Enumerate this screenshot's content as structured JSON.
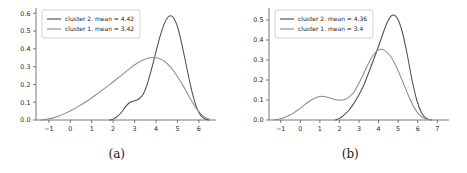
{
  "figure": {
    "background_color": "#ffffff",
    "axis_color": "#555555",
    "subfigures": [
      {
        "caption": "(a)",
        "chart_data": {
          "type": "line",
          "title": "",
          "xlabel": "",
          "ylabel": "",
          "xlim": [
            -1.6,
            6.8
          ],
          "ylim": [
            0.0,
            0.63
          ],
          "grid": false,
          "legend_position": "upper left",
          "xticks": [
            -1,
            0,
            1,
            2,
            3,
            4,
            5,
            6
          ],
          "xtick_labels": [
            "−1",
            "0",
            "1",
            "2",
            "3",
            "4",
            "5",
            "6"
          ],
          "yticks": [
            0.0,
            0.1,
            0.2,
            0.3,
            0.4,
            0.5,
            0.6
          ],
          "ytick_labels": [
            "0.0",
            "0.1",
            "0.2",
            "0.3",
            "0.4",
            "0.5",
            "0.6"
          ],
          "series": [
            {
              "name": "cluster 2. mean = 4.42",
              "color": "#4d4d4d",
              "mean": 4.42,
              "peak_x": 4.65,
              "peak_y": 0.585,
              "x": [
                1.85,
                2.0,
                2.2,
                2.4,
                2.6,
                2.8,
                3.0,
                3.2,
                3.4,
                3.6,
                3.8,
                4.0,
                4.2,
                4.4,
                4.6,
                4.8,
                5.0,
                5.2,
                5.4,
                5.6,
                5.8,
                6.0,
                6.2,
                6.45
              ],
              "y": [
                0.0,
                0.005,
                0.02,
                0.045,
                0.078,
                0.1,
                0.108,
                0.118,
                0.145,
                0.205,
                0.29,
                0.385,
                0.475,
                0.545,
                0.583,
                0.578,
                0.525,
                0.43,
                0.315,
                0.2,
                0.105,
                0.042,
                0.012,
                0.0
              ]
            },
            {
              "name": "cluster 1. mean = 3.42",
              "color": "#8c8c8c",
              "mean": 3.42,
              "peak_x": 3.85,
              "peak_y": 0.352,
              "x": [
                -1.35,
                -1.1,
                -0.8,
                -0.5,
                -0.2,
                0.1,
                0.4,
                0.8,
                1.2,
                1.6,
                2.0,
                2.4,
                2.8,
                3.1,
                3.4,
                3.7,
                3.9,
                4.1,
                4.4,
                4.7,
                5.0,
                5.3,
                5.6,
                5.9,
                6.2,
                6.5
              ],
              "y": [
                0.0,
                0.004,
                0.012,
                0.024,
                0.04,
                0.058,
                0.078,
                0.108,
                0.142,
                0.178,
                0.215,
                0.252,
                0.292,
                0.318,
                0.338,
                0.35,
                0.352,
                0.348,
                0.33,
                0.295,
                0.245,
                0.185,
                0.12,
                0.062,
                0.022,
                0.004
              ]
            }
          ]
        }
      },
      {
        "caption": "(b)",
        "chart_data": {
          "type": "line",
          "title": "",
          "xlabel": "",
          "ylabel": "",
          "xlim": [
            -1.6,
            7.6
          ],
          "ylim": [
            0.0,
            0.56
          ],
          "grid": false,
          "legend_position": "upper left",
          "xticks": [
            -1,
            0,
            1,
            2,
            3,
            4,
            5,
            6,
            7
          ],
          "xtick_labels": [
            "−1",
            "0",
            "1",
            "2",
            "3",
            "4",
            "5",
            "6",
            "7"
          ],
          "yticks": [
            0.0,
            0.1,
            0.2,
            0.3,
            0.4,
            0.5
          ],
          "ytick_labels": [
            "0.0",
            "0.1",
            "0.2",
            "0.3",
            "0.4",
            "0.5"
          ],
          "series": [
            {
              "name": "cluster 2. mean = 4.36",
              "color": "#4d4d4d",
              "mean": 4.36,
              "peak_x": 4.72,
              "peak_y": 0.525,
              "x": [
                1.8,
                2.0,
                2.2,
                2.45,
                2.7,
                2.95,
                3.2,
                3.45,
                3.7,
                3.95,
                4.2,
                4.45,
                4.7,
                4.95,
                5.2,
                5.45,
                5.7,
                5.95,
                6.2,
                6.45,
                6.7
              ],
              "y": [
                0.0,
                0.008,
                0.022,
                0.045,
                0.078,
                0.118,
                0.165,
                0.225,
                0.29,
                0.355,
                0.425,
                0.49,
                0.524,
                0.51,
                0.445,
                0.335,
                0.205,
                0.1,
                0.035,
                0.008,
                0.0
              ]
            },
            {
              "name": "cluster 1. mean = 3.4",
              "color": "#8c8c8c",
              "mean": 3.4,
              "peak_x": 4.05,
              "peak_y": 0.353,
              "bump_x": 1.2,
              "bump_y": 0.118,
              "x": [
                -1.35,
                -1.1,
                -0.8,
                -0.5,
                -0.2,
                0.1,
                0.4,
                0.7,
                1.0,
                1.2,
                1.45,
                1.7,
                1.95,
                2.15,
                2.4,
                2.7,
                3.0,
                3.3,
                3.6,
                3.85,
                4.05,
                4.3,
                4.6,
                4.9,
                5.2,
                5.5,
                5.8,
                6.1,
                6.4,
                6.7
              ],
              "y": [
                0.0,
                0.004,
                0.012,
                0.026,
                0.045,
                0.066,
                0.09,
                0.108,
                0.117,
                0.118,
                0.112,
                0.104,
                0.1,
                0.1,
                0.108,
                0.135,
                0.185,
                0.245,
                0.305,
                0.34,
                0.353,
                0.348,
                0.32,
                0.268,
                0.2,
                0.128,
                0.065,
                0.024,
                0.006,
                0.0
              ]
            }
          ]
        }
      }
    ]
  }
}
